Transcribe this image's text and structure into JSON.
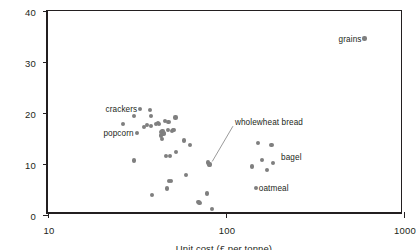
{
  "chart_data": {
    "type": "scatter",
    "title": "",
    "xlabel": "Unit cost (£ per tonne)",
    "ylabel": "Energy density (MJ/kg)",
    "xscale": "log",
    "yscale": "linear",
    "xlim": [
      10,
      1000
    ],
    "ylim": [
      0,
      40
    ],
    "xticks": [
      "10",
      "100",
      "1000"
    ],
    "xtick_values": [
      10,
      100,
      1000
    ],
    "yticks": [
      "0",
      "10",
      "20",
      "30",
      "40"
    ],
    "ytick_values": [
      0,
      10,
      20,
      30,
      40
    ],
    "grid": false,
    "legend": null,
    "marker_color": "#7f7f7f",
    "axis_color": "#231f20",
    "background": "#ffffff",
    "points": [
      {
        "x": 26.5,
        "y": 17.9
      },
      {
        "x": 30.5,
        "y": 19.4
      },
      {
        "x": 30.5,
        "y": 10.7
      },
      {
        "x": 34.5,
        "y": 17.3
      },
      {
        "x": 36.0,
        "y": 17.6
      },
      {
        "x": 37.5,
        "y": 20.6
      },
      {
        "x": 38.0,
        "y": 19.4
      },
      {
        "x": 38.0,
        "y": 17.5
      },
      {
        "x": 38.5,
        "y": 3.9
      },
      {
        "x": 40.5,
        "y": 17.9
      },
      {
        "x": 41.5,
        "y": 18.0
      },
      {
        "x": 42.0,
        "y": 17.9
      },
      {
        "x": 43.0,
        "y": 16.2
      },
      {
        "x": 43.0,
        "y": 15.6
      },
      {
        "x": 43.5,
        "y": 14.9
      },
      {
        "x": 44.0,
        "y": 16.5
      },
      {
        "x": 44.5,
        "y": 15.9
      },
      {
        "x": 45.0,
        "y": 16.1
      },
      {
        "x": 45.5,
        "y": 18.4
      },
      {
        "x": 46.0,
        "y": 11.5
      },
      {
        "x": 46.5,
        "y": 5.2
      },
      {
        "x": 47.0,
        "y": 16.6
      },
      {
        "x": 47.5,
        "y": 18.3
      },
      {
        "x": 48.0,
        "y": 6.6
      },
      {
        "x": 48.5,
        "y": 11.5
      },
      {
        "x": 49.0,
        "y": 6.6
      },
      {
        "x": 49.5,
        "y": 16.5
      },
      {
        "x": 50.5,
        "y": 16.6
      },
      {
        "x": 51.0,
        "y": 16.7
      },
      {
        "x": 52.0,
        "y": 19.1
      },
      {
        "x": 52.5,
        "y": 12.3
      },
      {
        "x": 58.0,
        "y": 14.6
      },
      {
        "x": 59.5,
        "y": 7.9
      },
      {
        "x": 63.0,
        "y": 13.8
      },
      {
        "x": 70.0,
        "y": 2.5
      },
      {
        "x": 71.0,
        "y": 2.4
      },
      {
        "x": 78.0,
        "y": 4.2
      },
      {
        "x": 79.0,
        "y": 10.3
      },
      {
        "x": 80.0,
        "y": 10.0
      },
      {
        "x": 80.5,
        "y": 9.8
      },
      {
        "x": 81.5,
        "y": 9.9
      },
      {
        "x": 83.0,
        "y": 1.2
      },
      {
        "x": 140.0,
        "y": 9.5
      },
      {
        "x": 152.0,
        "y": 14.1
      },
      {
        "x": 160.0,
        "y": 10.8
      },
      {
        "x": 170.0,
        "y": 8.9
      },
      {
        "x": 180.0,
        "y": 13.8
      },
      {
        "x": 183.0,
        "y": 10.2
      }
    ],
    "annotations": [
      {
        "id": "crackers",
        "label": "crackers",
        "x": 33.0,
        "y": 20.8,
        "label_side": "left",
        "marker": true,
        "leader": false
      },
      {
        "id": "popcorn",
        "label": "popcorn",
        "x": 31.5,
        "y": 16.1,
        "label_side": "left",
        "marker": true,
        "leader": false
      },
      {
        "id": "wholewheat-bread",
        "label": "wholewheat bread",
        "x": 80.5,
        "y": 9.9,
        "label_x": 108.0,
        "label_y": 18.2,
        "label_side": "right",
        "marker": false,
        "leader": true
      },
      {
        "id": "bagel",
        "label": "bagel",
        "x": 196.0,
        "y": 11.3,
        "label_side": "right",
        "marker": false,
        "leader": false
      },
      {
        "id": "oatmeal",
        "label": "oatmeal",
        "x": 147.0,
        "y": 5.3,
        "label_side": "right",
        "marker": true,
        "leader": false
      },
      {
        "id": "grains",
        "label": "grains",
        "x": 600.0,
        "y": 34.6,
        "label_side": "left",
        "marker": true,
        "leader": false
      }
    ]
  }
}
